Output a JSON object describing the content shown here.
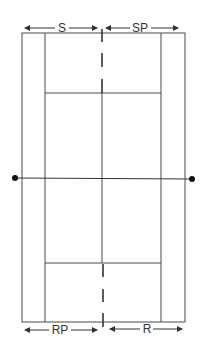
{
  "diagram": {
    "type": "tennis-court-positions",
    "colors": {
      "line": "#4a4a4a",
      "arrow": "#333333",
      "dot": "#111111",
      "background": "#ffffff"
    },
    "labels": {
      "top_left": "S",
      "top_right": "SP",
      "bottom_left": "RP",
      "bottom_right": "R"
    },
    "label_meanings_visible": [
      "S",
      "SP",
      "RP",
      "R"
    ]
  }
}
